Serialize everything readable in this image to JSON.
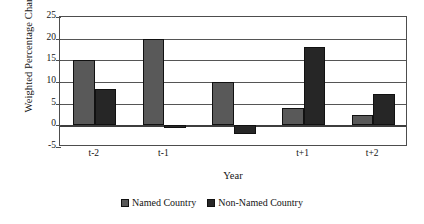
{
  "chart_data": {
    "type": "bar",
    "title": "",
    "subtitle": "",
    "xlabel": "Year",
    "ylabel": "Weighted Percentage Change",
    "categories": [
      "t-2",
      "t-1",
      "",
      "t+1",
      "t+2"
    ],
    "tick_labels_visible": [
      "t-2",
      "t-1",
      "t+1",
      "t+2"
    ],
    "series": [
      {
        "name": "Named Country",
        "color": "#595959",
        "values": [
          15,
          20,
          10,
          4,
          2.5
        ]
      },
      {
        "name": "Non-Named Country",
        "color": "#262626",
        "values": [
          8.5,
          -0.6,
          -2,
          18,
          7.3
        ]
      }
    ],
    "ylim": [
      -5,
      25
    ],
    "ytick_values": [
      25,
      20,
      15,
      10,
      5,
      0,
      -5
    ],
    "ytick_labels": [
      "25",
      "20",
      "15",
      "10",
      "5",
      "0",
      "-5"
    ],
    "grid": true,
    "grid_axis": "y",
    "legend_position": "bottom-center",
    "plot_border": true
  },
  "legend": {
    "entries": [
      {
        "label": "Named Country",
        "swatch": "legend-swatch-named"
      },
      {
        "label": "Non-Named Country",
        "swatch": "legend-swatch-non-named"
      }
    ]
  }
}
